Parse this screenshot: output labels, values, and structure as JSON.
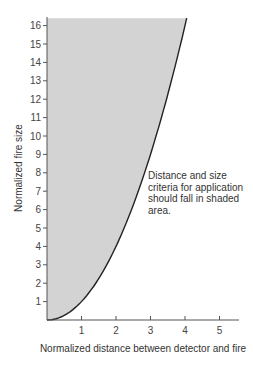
{
  "chart_data": {
    "type": "area",
    "title": "",
    "xlabel": "Normalized distance between detector and fire",
    "ylabel": "Normalized fire size",
    "x_ticks": [
      1,
      2,
      3,
      4,
      5
    ],
    "y_ticks": [
      1,
      2,
      3,
      4,
      5,
      6,
      7,
      8,
      9,
      10,
      11,
      12,
      13,
      14,
      15,
      16
    ],
    "xlim": [
      0,
      5.6
    ],
    "ylim": [
      0,
      16.4
    ],
    "grid": false,
    "series": [
      {
        "name": "Boundary curve (fire size = distance²)",
        "x": [
          0,
          0.5,
          1,
          1.5,
          2,
          2.5,
          3,
          3.5,
          4,
          4.05
        ],
        "y": [
          0,
          0.25,
          1,
          2.25,
          4,
          6.25,
          9,
          12.25,
          16,
          16.4
        ]
      }
    ],
    "shaded_region": "Area between y-axis and curve (above curve)",
    "shade_color": "#d3d3d3",
    "curve_color": "#222222",
    "annotation": "Distance and size\ncriteria for application\nshould fall in shaded\narea."
  }
}
